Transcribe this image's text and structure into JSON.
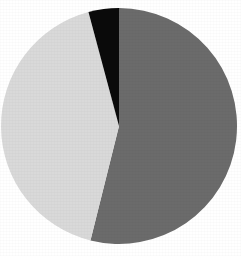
{
  "figure": {
    "background_color": "#ffffff",
    "width": 241,
    "height": 256
  },
  "chart_data": {
    "type": "pie",
    "title": "",
    "subtitle": "",
    "xlabel": "",
    "ylabel": "",
    "grid": false,
    "legend": false,
    "legend_position": "none",
    "labels": [
      "Segment 1",
      "Segment 2",
      "Segment 3"
    ],
    "values": [
      54,
      42,
      4
    ],
    "unit": "%",
    "total": 100,
    "angles_deg": [
      194,
      151,
      15
    ],
    "start_angle_deg": 0,
    "direction": "clockwise",
    "colors": [
      "#6b6b6b",
      "#d9d9d9",
      "#0a0a0a"
    ],
    "slices": [
      {
        "label": "Segment 1",
        "value": 54,
        "angle_deg": 194,
        "color": "#6b6b6b",
        "color_name": "dark-gray",
        "start_deg": 0,
        "end_deg": 194,
        "exploded": false,
        "data_label": ""
      },
      {
        "label": "Segment 2",
        "value": 42,
        "angle_deg": 151,
        "color": "#d9d9d9",
        "color_name": "light-gray",
        "start_deg": 194,
        "end_deg": 345,
        "exploded": false,
        "data_label": ""
      },
      {
        "label": "Segment 3",
        "value": 4,
        "angle_deg": 15,
        "color": "#0a0a0a",
        "color_name": "black",
        "start_deg": 345,
        "end_deg": 360,
        "exploded": false,
        "data_label": ""
      }
    ],
    "geometry": {
      "center_x": 119,
      "center_y": 126,
      "radius": 118
    },
    "annotations": []
  }
}
